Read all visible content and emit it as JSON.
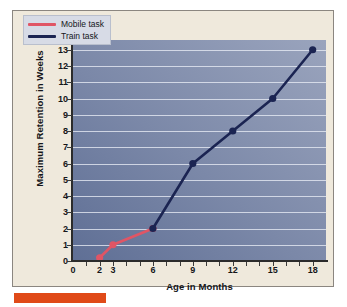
{
  "chart_data": {
    "type": "line",
    "title": "",
    "xlabel": "Age in Months",
    "ylabel": "Maximum Retention in Weeks",
    "xlim": [
      0,
      19
    ],
    "ylim": [
      0,
      13.6
    ],
    "grid": true,
    "legend_position": "top-left",
    "x_ticks": [
      0,
      2,
      3,
      6,
      9,
      12,
      15,
      18
    ],
    "x_tick_labels": [
      "0",
      "2",
      "3",
      "6",
      "9",
      "12",
      "15",
      "18"
    ],
    "x_minor_ticks": [
      1,
      2,
      3,
      4,
      5,
      6,
      7,
      8,
      9,
      10,
      11,
      12,
      13,
      14,
      15,
      16,
      17,
      18
    ],
    "y_ticks": [
      0,
      1,
      2,
      3,
      4,
      5,
      6,
      7,
      8,
      9,
      10,
      11,
      12,
      13
    ],
    "y_tick_labels": [
      "0",
      "1",
      "2",
      "3",
      "4",
      "5",
      "6",
      "7",
      "8",
      "9",
      "10",
      "11",
      "12",
      "13"
    ],
    "series": [
      {
        "name": "Mobile task",
        "color": "#e05565",
        "marker": "circle",
        "x": [
          2,
          3,
          6
        ],
        "y": [
          0.2,
          1,
          2
        ]
      },
      {
        "name": "Train task",
        "color": "#1b2452",
        "marker": "circle",
        "x": [
          6,
          9,
          12,
          15,
          18
        ],
        "y": [
          2,
          6,
          8,
          10,
          13
        ]
      }
    ]
  },
  "legend": {
    "entries": [
      {
        "label": "Mobile task",
        "color": "#e05565"
      },
      {
        "label": "Train task",
        "color": "#1b2452"
      }
    ]
  },
  "colors": {
    "panel_background": "#efe9dc",
    "panel_border": "#8b8680",
    "plot_background_dark": "#5f6f95",
    "plot_background_light": "#9aa4bd",
    "gridline": "#e8ecf5",
    "axis": "#2b2b2b",
    "mobile_task": "#e05565",
    "train_task": "#1b2452",
    "accent_bar": "#e04a18"
  },
  "bottom_bar": {
    "label": ""
  }
}
